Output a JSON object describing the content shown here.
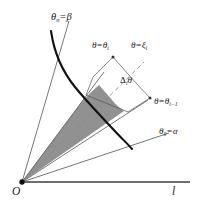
{
  "figure": {
    "type": "geometric-diagram",
    "width": 203,
    "height": 209,
    "background_color": "#ffffff"
  },
  "colors": {
    "stroke": "#333333",
    "curve": "#111111",
    "shaded_sector": "#8c8c8c",
    "dashed_ray": "#7a7a7a",
    "leader_line": "#555555",
    "axis": "#6e6e6e",
    "text": "#1a1a1a"
  },
  "labels": {
    "theta_n": {
      "theta": "θ",
      "sub": "n",
      "eq": "=",
      "value": "β"
    },
    "theta_i": {
      "theta": "θ",
      "eq": "=",
      "value_theta": "θ",
      "value_sub": "i"
    },
    "xi_i": {
      "theta": "θ",
      "eq": "=",
      "value_xi": "ξ",
      "value_sub": "i"
    },
    "delta_i_theta": {
      "delta": "Δ",
      "sub": "i",
      "theta": "θ"
    },
    "theta_i_minus_1": {
      "theta": "θ",
      "eq": "=",
      "value_theta": "θ",
      "value_sub": "i−1"
    },
    "theta_0": {
      "theta": "θ",
      "sub": "0",
      "eq": "=",
      "value": "α"
    },
    "origin": "O",
    "axis": "l"
  },
  "geometry": {
    "origin": {
      "x": 22,
      "y": 182
    },
    "axis_end": {
      "x": 190,
      "y": 182
    },
    "rays": [
      {
        "name": "theta-n-beta",
        "x2": 69,
        "y2": 21
      },
      {
        "name": "theta-i",
        "x2": 101,
        "y2": 82
      },
      {
        "name": "xi-i",
        "x2": 140,
        "y2": 72,
        "dashed": true
      },
      {
        "name": "theta-i-minus-1",
        "x2": 124,
        "y2": 111
      },
      {
        "name": "theta-0-alpha",
        "x2": 169,
        "y2": 133
      }
    ],
    "curve": "S-shaped polar curve r=f(theta)",
    "shaded_region": "sector between theta_i and theta_i-1 bounded by the curve"
  }
}
